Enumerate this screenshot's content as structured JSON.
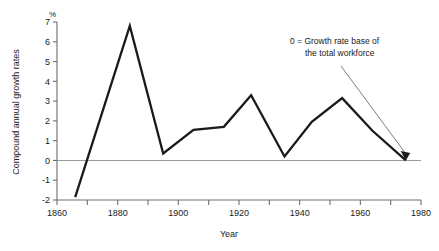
{
  "chart_data": {
    "type": "line",
    "title": "",
    "xlabel": "Year",
    "ylabel": "Compound annual growth rates",
    "yunit": "%",
    "xlim": [
      1860,
      1980
    ],
    "ylim": [
      -2,
      7
    ],
    "grid": false,
    "legend": "none",
    "xticks": [
      1860,
      1870,
      1880,
      1890,
      1900,
      1910,
      1920,
      1930,
      1940,
      1950,
      1960,
      1970,
      1980
    ],
    "xtick_labels": [
      "1860",
      "",
      "1880",
      "",
      "1900",
      "",
      "1920",
      "",
      "1940",
      "",
      "1960",
      "",
      "1980"
    ],
    "yticks": [
      -2,
      -1,
      0,
      1,
      2,
      3,
      4,
      5,
      6,
      7
    ],
    "ytick_labels": [
      "-2",
      "-1",
      "0",
      "1",
      "2",
      "3",
      "4",
      "5",
      "6",
      "7"
    ],
    "series": [
      {
        "name": "Compound annual growth rate",
        "x": [
          1866,
          1884,
          1895,
          1905,
          1915,
          1924,
          1935,
          1944,
          1954,
          1964,
          1975
        ],
        "values": [
          -1.85,
          6.8,
          0.35,
          1.55,
          1.7,
          3.3,
          0.2,
          1.95,
          3.15,
          1.5,
          0.0
        ]
      }
    ],
    "zero_reference_line": 0,
    "annotations": [
      {
        "name": "zero-base-note",
        "line1": "0 = Growth rate base of",
        "line2": "the total workforce",
        "points_to_x": 1975,
        "points_to_y": 0
      }
    ],
    "colors": {
      "line": "#1a1a1a",
      "axis": "#6e6e6e",
      "zero_line": "#9a9a9a",
      "leader": "#6e6e6e",
      "background": "#ffffff"
    }
  }
}
